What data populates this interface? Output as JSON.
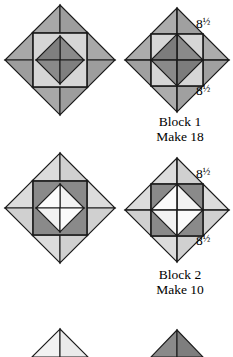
{
  "page": {
    "kind": "quilt-block-assembly-diagram",
    "width": 233,
    "height": 357,
    "background": "#ffffff"
  },
  "palette": {
    "white": "#ffffff",
    "very_light": "#f2f2f2",
    "light": "#d6d6d6",
    "medium_light": "#c4c4c4",
    "medium": "#a8a8a8",
    "dark": "#8a8a8a",
    "darker": "#6e6e6e",
    "outline": "#1a1a1a"
  },
  "blocks": [
    {
      "id": "block-1",
      "caption_title": "Block 1",
      "caption_make": "Make 18",
      "dimension_top": "8",
      "dimension_top_fraction": "½",
      "dimension_bottom": "8",
      "dimension_bottom_fraction": "½",
      "exploded": {
        "center_square_fill": "#d6d6d6",
        "center_diamond_fill": "#8a8a8a",
        "flying_triangle_fill": "#a8a8a8"
      },
      "assembled": {
        "corner_triangle_fill": "#a8a8a8",
        "ring_square_fill": "#d6d6d6",
        "center_diamond_fill": "#8a8a8a"
      }
    },
    {
      "id": "block-2",
      "caption_title": "Block 2",
      "caption_make": "Make 10",
      "dimension_top": "8",
      "dimension_top_fraction": "½",
      "dimension_bottom": "8",
      "dimension_bottom_fraction": "½",
      "exploded": {
        "center_square_fill": "#8a8a8a",
        "center_diamond_fill": "#f2f2f2",
        "flying_triangle_fill": "#d6d6d6"
      },
      "assembled": {
        "corner_triangle_fill": "#d6d6d6",
        "ring_square_fill": "#8a8a8a",
        "center_diamond_fill": "#f2f2f2"
      }
    },
    {
      "id": "block-3",
      "caption_title": "",
      "caption_make": "",
      "partial": true,
      "exploded": {
        "flying_triangle_fill": "#f2f2f2"
      },
      "assembled": {
        "flying_triangle_fill": "#8a8a8a"
      }
    }
  ],
  "dimension_unit_note": ""
}
